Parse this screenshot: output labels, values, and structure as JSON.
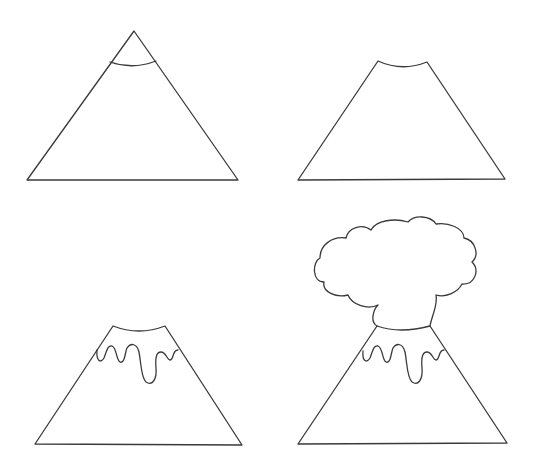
{
  "steps": [
    {
      "index": 1,
      "description": "Triangle with a curved line near the peak"
    },
    {
      "index": 2,
      "description": "Flattened top with concave crater rim"
    },
    {
      "index": 3,
      "description": "Wavy lava drips below the crater"
    },
    {
      "index": 4,
      "description": "Smoke cloud erupting from the crater"
    }
  ],
  "colors": {
    "stroke": "#3a3a3a",
    "background": "#ffffff"
  }
}
